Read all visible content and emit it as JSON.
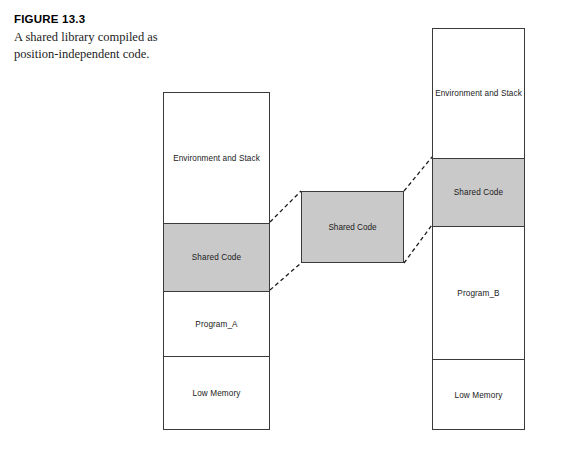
{
  "caption": {
    "figure_number": "FIGURE 13.3",
    "description": "A shared library compiled as position-independent code."
  },
  "diagram": {
    "colors": {
      "shaded_fill": "#c9c9c9",
      "box_stroke": "#3a3a3a",
      "background": "#ffffff",
      "connector": "#1a1a1a"
    },
    "left_column": {
      "name": "Program_A address space",
      "segments": [
        {
          "label": "Environment and Stack",
          "shaded": false
        },
        {
          "label": "Shared Code",
          "shaded": true
        },
        {
          "label": "Program_A",
          "shaded": false
        },
        {
          "label": "Low Memory",
          "shaded": false
        }
      ]
    },
    "center_block": {
      "label": "Shared Code",
      "shaded": true
    },
    "right_column": {
      "name": "Program_B address space",
      "segments": [
        {
          "label": "Environment and Stack",
          "shaded": false
        },
        {
          "label": "Shared Code",
          "shaded": true
        },
        {
          "label": "Program_B",
          "shaded": false
        },
        {
          "label": "Low Memory",
          "shaded": false
        }
      ]
    },
    "connectors": [
      {
        "from": "left-shared-top-right",
        "to": "center-top-left",
        "style": "dashed"
      },
      {
        "from": "left-shared-bottom-right",
        "to": "center-bottom-left",
        "style": "dashed"
      },
      {
        "from": "center-top-right",
        "to": "right-shared-top-left",
        "style": "dashed"
      },
      {
        "from": "center-bottom-right",
        "to": "right-shared-bottom-left",
        "style": "dashed"
      }
    ]
  }
}
